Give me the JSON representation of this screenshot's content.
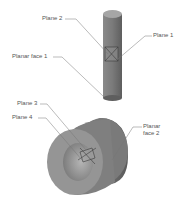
{
  "figure": {
    "labels": {
      "plane_2": "Plane 2",
      "plane_1": "Plane 1",
      "planar_face_1": "Planar face 1",
      "plane_3": "Plane 3",
      "plane_4": "Plane 4",
      "planar_face_2_line1": "Planar",
      "planar_face_2_line2": "face 2"
    },
    "colors": {
      "background": "#ffffff",
      "part_dark": "#6e6e6e",
      "part_mid": "#8a8a8a",
      "part_light": "#a8a8a8",
      "leader_line": "#777777",
      "label_text": "#555555"
    }
  }
}
